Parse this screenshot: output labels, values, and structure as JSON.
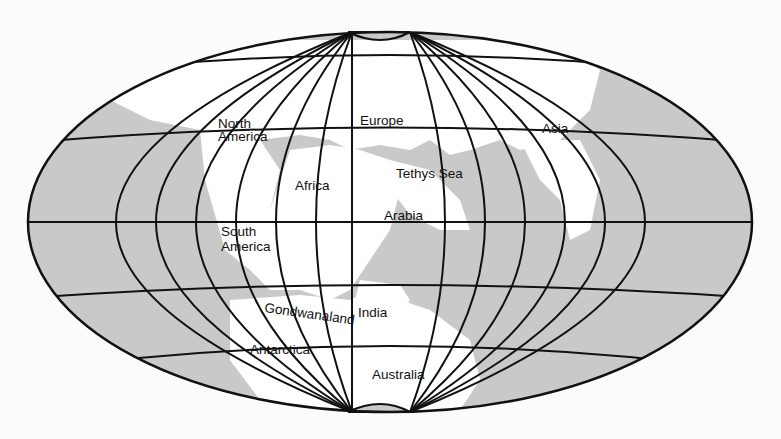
{
  "map": {
    "projection": "elliptical (Mollweide-like) world projection",
    "colors": {
      "ocean": "#c9c9c9",
      "land": "#ffffff",
      "gridlines": "#111111",
      "background": "#fbfbfb"
    },
    "labels": [
      {
        "id": "north-america",
        "lines": [
          "North",
          "America"
        ]
      },
      {
        "id": "europe",
        "lines": [
          "Europe"
        ]
      },
      {
        "id": "asia",
        "lines": [
          "Asia"
        ]
      },
      {
        "id": "africa",
        "lines": [
          "Africa"
        ]
      },
      {
        "id": "tethys-sea",
        "lines": [
          "Tethys Sea"
        ]
      },
      {
        "id": "arabia",
        "lines": [
          "Arabia"
        ]
      },
      {
        "id": "south-america",
        "lines": [
          "South",
          "America"
        ]
      },
      {
        "id": "gondwanaland",
        "lines": [
          "Gondwanaland"
        ]
      },
      {
        "id": "india",
        "lines": [
          "India"
        ]
      },
      {
        "id": "antarctica",
        "lines": [
          "Antarctica"
        ]
      },
      {
        "id": "australia",
        "lines": [
          "Australia"
        ]
      }
    ]
  }
}
